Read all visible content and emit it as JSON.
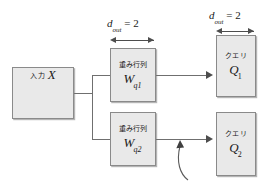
{
  "diagram": {
    "colors": {
      "box_fill": "#e9e9e9",
      "box_border": "#8a8a8a",
      "line": "#6f6f6f",
      "arrow": "#4d4d4d",
      "text": "#1a1a1a",
      "background": "#ffffff"
    },
    "input_box": {
      "label_jp": "入力",
      "symbol": "X"
    },
    "weight_boxes": [
      {
        "label_jp": "重み行列",
        "symbol": "W",
        "subscript": "q1"
      },
      {
        "label_jp": "重み行列",
        "symbol": "W",
        "subscript": "q2"
      }
    ],
    "query_boxes": [
      {
        "label_jp": "クエリ",
        "symbol": "Q",
        "subscript": "1"
      },
      {
        "label_jp": "クエリ",
        "symbol": "Q",
        "subscript": "2"
      }
    ],
    "dimensions": [
      {
        "symbol": "d",
        "subscript": "out",
        "operator": "=",
        "value": "2"
      },
      {
        "symbol": "d",
        "subscript": "out",
        "operator": "=",
        "value": "2"
      }
    ],
    "annotation_arrow": {
      "name": "curved-pointer",
      "points_to": "lower-output-line"
    }
  }
}
